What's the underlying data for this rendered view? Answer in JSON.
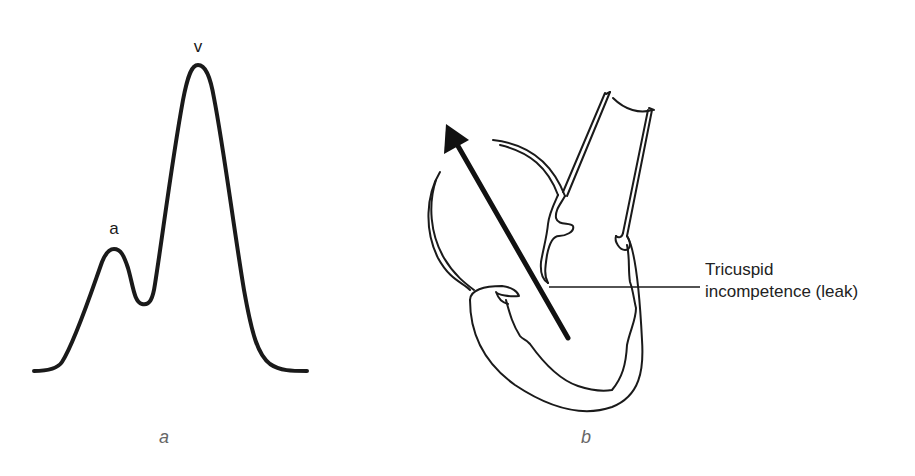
{
  "figure": {
    "panel_a": {
      "caption": "a",
      "description": "Jugular venous pressure waveform with giant v wave",
      "peaks": [
        {
          "label": "a",
          "x": 113,
          "y": 250
        },
        {
          "label": "v",
          "x": 198,
          "y": 66
        }
      ],
      "trough": {
        "x": 142,
        "y": 304
      },
      "baseline_y": 370
    },
    "panel_b": {
      "caption": "b",
      "description": "Heart cross-section showing regurgitant flow through tricuspid valve",
      "callout": {
        "line1": "Tricuspid",
        "line2": "incompetence (leak)"
      },
      "arrow": {
        "from": [
          568,
          338
        ],
        "to": [
          446,
          124
        ],
        "icon": "regurgitation-arrow-icon"
      }
    },
    "colors": {
      "stroke": "#1a1a1a",
      "caption": "#666666",
      "background": "#ffffff"
    }
  }
}
